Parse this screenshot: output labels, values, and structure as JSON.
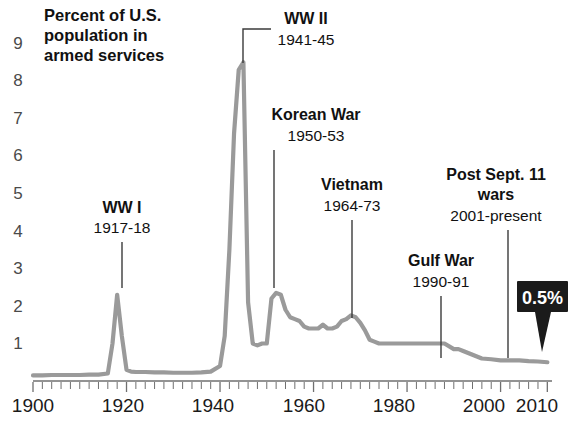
{
  "chart_data": {
    "type": "line",
    "title": "Percent of U.S. population in armed services",
    "title_lines": [
      "Percent of U.S.",
      "population in",
      "armed services"
    ],
    "xlabel": "",
    "ylabel": "Percent of U.S. population in armed services",
    "xlim": [
      1900,
      2011
    ],
    "ylim": [
      0,
      9.4
    ],
    "yticks": [
      1,
      2,
      3,
      4,
      5,
      6,
      7,
      8,
      9
    ],
    "ytick_labels": [
      "1",
      "2",
      "3",
      "4",
      "5",
      "6",
      "7",
      "8",
      "9"
    ],
    "xticks": [
      1900,
      1920,
      1940,
      1960,
      1980,
      2000,
      2010
    ],
    "xtick_labels": [
      "1900",
      "1920",
      "1940",
      "1960",
      "1980",
      "2000",
      "2010"
    ],
    "x_minor_tick_interval": 2,
    "grid": false,
    "legend": "none",
    "series": [
      {
        "name": "Percent of U.S. population in armed services",
        "color": "#9a9a9a",
        "x": [
          1900,
          1902,
          1904,
          1906,
          1908,
          1910,
          1912,
          1914,
          1916,
          1917,
          1918,
          1919,
          1920,
          1921,
          1922,
          1924,
          1926,
          1928,
          1930,
          1932,
          1934,
          1936,
          1938,
          1940,
          1941,
          1942,
          1943,
          1944,
          1945,
          1946,
          1947,
          1948,
          1949,
          1950,
          1951,
          1952,
          1953,
          1954,
          1955,
          1956,
          1957,
          1958,
          1959,
          1960,
          1961,
          1962,
          1963,
          1964,
          1965,
          1966,
          1967,
          1968,
          1969,
          1970,
          1971,
          1972,
          1973,
          1974,
          1976,
          1978,
          1980,
          1982,
          1984,
          1986,
          1988,
          1990,
          1991,
          1992,
          1994,
          1996,
          1998,
          2000,
          2002,
          2004,
          2006,
          2008,
          2010
        ],
        "y": [
          0.15,
          0.15,
          0.16,
          0.16,
          0.16,
          0.16,
          0.17,
          0.17,
          0.2,
          1.0,
          2.3,
          1.2,
          0.3,
          0.25,
          0.24,
          0.24,
          0.23,
          0.23,
          0.22,
          0.22,
          0.22,
          0.23,
          0.25,
          0.4,
          1.2,
          3.5,
          6.6,
          8.3,
          8.5,
          2.1,
          1.0,
          0.95,
          1.0,
          1.0,
          2.2,
          2.35,
          2.3,
          1.9,
          1.7,
          1.65,
          1.6,
          1.45,
          1.4,
          1.4,
          1.4,
          1.5,
          1.4,
          1.4,
          1.45,
          1.6,
          1.65,
          1.75,
          1.7,
          1.55,
          1.35,
          1.1,
          1.05,
          1.0,
          1.0,
          1.0,
          1.0,
          1.0,
          1.0,
          1.0,
          1.0,
          0.85,
          0.85,
          0.8,
          0.7,
          0.6,
          0.58,
          0.55,
          0.55,
          0.55,
          0.53,
          0.52,
          0.5
        ]
      }
    ],
    "annotations": [
      {
        "id": "ww1",
        "name": "WW I",
        "years": "1917-18",
        "value_year": 1918
      },
      {
        "id": "ww2",
        "name": "WW II",
        "years": "1941-45",
        "value_year": 1945
      },
      {
        "id": "korea",
        "name": "Korean War",
        "years": "1950-53",
        "value_year": 1952
      },
      {
        "id": "vietnam",
        "name": "Vietnam",
        "years": "1964-73",
        "value_year": 1968
      },
      {
        "id": "gulf",
        "name": "Gulf War",
        "years": "1990-91",
        "value_year": 1991
      },
      {
        "id": "post911",
        "name_lines": [
          "Post Sept. 11",
          "wars"
        ],
        "name": "Post Sept. 11 wars",
        "years": "2001-present",
        "value_year": 2006
      }
    ],
    "callout": {
      "label": "0.5%",
      "year": 2010,
      "value": 0.5,
      "background": "#1b1b1b",
      "text_color": "#ffffff"
    }
  },
  "colors": {
    "line": "#9a9a9a",
    "axis": "#6f6f6f",
    "text": "#111111",
    "ytick": "#4a4a4a",
    "callout_bg": "#1b1b1b"
  }
}
